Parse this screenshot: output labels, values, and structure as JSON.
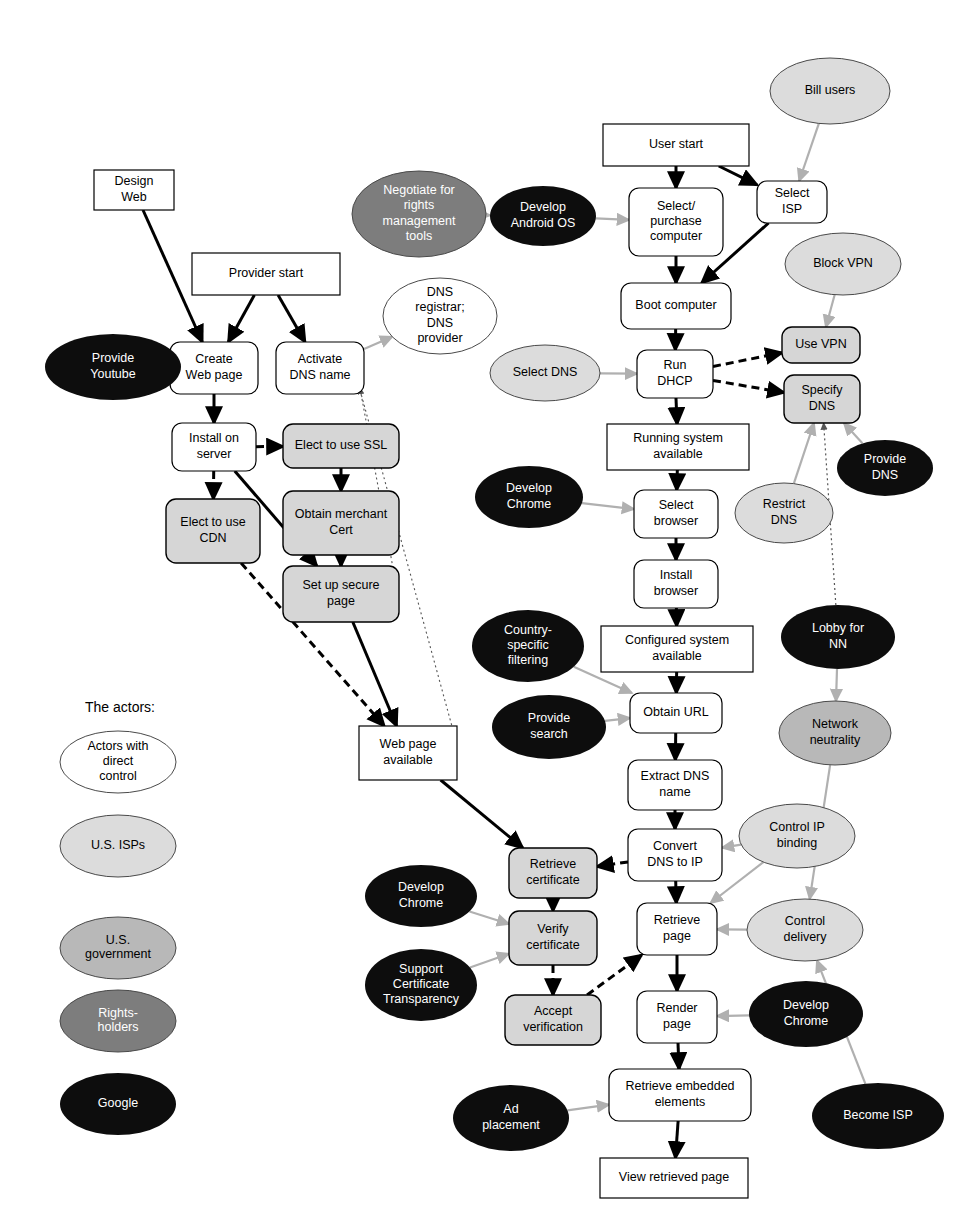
{
  "diagram": {
    "legend": {
      "heading": "The actors:",
      "items": [
        {
          "label": "Actors with direct control",
          "fill": "#ffffff",
          "text": "#000000"
        },
        {
          "label": "U.S. ISPs",
          "fill": "#dcdcdc",
          "text": "#000000"
        },
        {
          "label": "U.S. government",
          "fill": "#b8b8b8",
          "text": "#000000"
        },
        {
          "label": "Rights-holders",
          "fill": "#7d7d7d",
          "text": "#ffffff"
        },
        {
          "label": "Google",
          "fill": "#0d0d0d",
          "text": "#ffffff"
        }
      ]
    },
    "colors": {
      "white": "#ffffff",
      "grey_box": "#d6d6d6",
      "isp": "#dcdcdc",
      "government": "#b8b8b8",
      "rights": "#7d7d7d",
      "google": "#0d0d0d",
      "stroke": "#000000",
      "grey_arrow": "#b0b0b0"
    },
    "process_nodes": [
      {
        "id": "design-web",
        "label": "Design\nWeb",
        "shape": "rect",
        "fill": "#ffffff",
        "x": 94,
        "y": 170,
        "w": 80,
        "h": 40
      },
      {
        "id": "provider-start",
        "label": "Provider start",
        "shape": "rect",
        "fill": "#ffffff",
        "x": 192,
        "y": 253,
        "w": 148,
        "h": 42
      },
      {
        "id": "create-web-page",
        "label": "Create\nWeb page",
        "shape": "round",
        "fill": "#ffffff",
        "x": 170,
        "y": 342,
        "w": 88,
        "h": 52
      },
      {
        "id": "activate-dns-name",
        "label": "Activate\nDNS name",
        "shape": "round",
        "fill": "#ffffff",
        "x": 276,
        "y": 342,
        "w": 88,
        "h": 52
      },
      {
        "id": "install-on-server",
        "label": "Install on\nserver",
        "shape": "round",
        "fill": "#ffffff",
        "x": 172,
        "y": 423,
        "w": 84,
        "h": 48
      },
      {
        "id": "elect-to-use-ssl",
        "label": "Elect to use SSL",
        "shape": "round",
        "fill": "#d6d6d6",
        "x": 283,
        "y": 424,
        "w": 116,
        "h": 44
      },
      {
        "id": "elect-to-use-cdn",
        "label": "Elect to use\nCDN",
        "shape": "round",
        "fill": "#d6d6d6",
        "x": 166,
        "y": 499,
        "w": 94,
        "h": 64
      },
      {
        "id": "obtain-merchant-cert",
        "label": "Obtain merchant\nCert",
        "shape": "round",
        "fill": "#d6d6d6",
        "x": 283,
        "y": 491,
        "w": 116,
        "h": 64
      },
      {
        "id": "set-up-secure-page",
        "label": "Set up secure\npage",
        "shape": "round",
        "fill": "#d6d6d6",
        "x": 283,
        "y": 566,
        "w": 116,
        "h": 56
      },
      {
        "id": "web-page-available",
        "label": "Web page\navailable",
        "shape": "rect",
        "fill": "#ffffff",
        "x": 359,
        "y": 726,
        "w": 98,
        "h": 54
      },
      {
        "id": "user-start",
        "label": "User start",
        "shape": "rect",
        "fill": "#ffffff",
        "x": 603,
        "y": 124,
        "w": 146,
        "h": 42
      },
      {
        "id": "select-isp",
        "label": "Select\nISP",
        "shape": "round",
        "fill": "#ffffff",
        "x": 757,
        "y": 181,
        "w": 70,
        "h": 42
      },
      {
        "id": "select-purchase-computer",
        "label": "Select/\npurchase\ncomputer",
        "shape": "round",
        "fill": "#ffffff",
        "x": 629,
        "y": 188,
        "w": 94,
        "h": 68
      },
      {
        "id": "boot-computer",
        "label": "Boot computer",
        "shape": "round",
        "fill": "#ffffff",
        "x": 621,
        "y": 283,
        "w": 110,
        "h": 46
      },
      {
        "id": "run-dhcp",
        "label": "Run\nDHCP",
        "shape": "round",
        "fill": "#ffffff",
        "x": 637,
        "y": 350,
        "w": 76,
        "h": 48
      },
      {
        "id": "use-vpn",
        "label": "Use VPN",
        "shape": "round",
        "fill": "#d6d6d6",
        "x": 782,
        "y": 327,
        "w": 78,
        "h": 36
      },
      {
        "id": "specify-dns",
        "label": "Specify\nDNS",
        "shape": "round",
        "fill": "#d6d6d6",
        "x": 784,
        "y": 375,
        "w": 76,
        "h": 48
      },
      {
        "id": "running-system-available",
        "label": "Running system\navailable",
        "shape": "rect",
        "fill": "#ffffff",
        "x": 607,
        "y": 424,
        "w": 142,
        "h": 46
      },
      {
        "id": "select-browser",
        "label": "Select\nbrowser",
        "shape": "round",
        "fill": "#ffffff",
        "x": 634,
        "y": 490,
        "w": 84,
        "h": 48
      },
      {
        "id": "install-browser",
        "label": "Install\nbrowser",
        "shape": "round",
        "fill": "#ffffff",
        "x": 634,
        "y": 560,
        "w": 84,
        "h": 48
      },
      {
        "id": "configured-system-available",
        "label": "Configured system\navailable",
        "shape": "rect",
        "fill": "#ffffff",
        "x": 601,
        "y": 626,
        "w": 152,
        "h": 46
      },
      {
        "id": "obtain-url",
        "label": "Obtain URL",
        "shape": "round",
        "fill": "#ffffff",
        "x": 630,
        "y": 693,
        "w": 92,
        "h": 40
      },
      {
        "id": "extract-dns-name",
        "label": "Extract DNS\nname",
        "shape": "round",
        "fill": "#ffffff",
        "x": 628,
        "y": 760,
        "w": 94,
        "h": 50
      },
      {
        "id": "convert-dns-to-ip",
        "label": "Convert\nDNS to IP",
        "shape": "round",
        "fill": "#ffffff",
        "x": 628,
        "y": 829,
        "w": 94,
        "h": 52
      },
      {
        "id": "retrieve-certificate",
        "label": "Retrieve\ncertificate",
        "shape": "round",
        "fill": "#d6d6d6",
        "x": 509,
        "y": 848,
        "w": 88,
        "h": 50
      },
      {
        "id": "verify-certificate",
        "label": "Verify\ncertificate",
        "shape": "round",
        "fill": "#d6d6d6",
        "x": 509,
        "y": 911,
        "w": 88,
        "h": 54
      },
      {
        "id": "accept-verification",
        "label": "Accept\nverification",
        "shape": "round",
        "fill": "#d6d6d6",
        "x": 505,
        "y": 995,
        "w": 96,
        "h": 50
      },
      {
        "id": "retrieve-page",
        "label": "Retrieve\npage",
        "shape": "round",
        "fill": "#ffffff",
        "x": 637,
        "y": 903,
        "w": 80,
        "h": 52
      },
      {
        "id": "render-page",
        "label": "Render\npage",
        "shape": "round",
        "fill": "#ffffff",
        "x": 637,
        "y": 991,
        "w": 80,
        "h": 52
      },
      {
        "id": "retrieve-embedded-elements",
        "label": "Retrieve embedded\nelements",
        "shape": "round",
        "fill": "#ffffff",
        "x": 609,
        "y": 1069,
        "w": 142,
        "h": 52
      },
      {
        "id": "view-retrieved-page",
        "label": "View retrieved page",
        "shape": "rect",
        "fill": "#ffffff",
        "x": 600,
        "y": 1158,
        "w": 148,
        "h": 40
      }
    ],
    "actor_nodes": [
      {
        "id": "provide-youtube",
        "label": "Provide\nYoutube",
        "fill": "#0d0d0d",
        "text": "#ffffff",
        "cx": 113,
        "cy": 367,
        "rx": 68,
        "ry": 33
      },
      {
        "id": "negotiate-rights",
        "label": "Negotiate for\nrights\nmanagement\ntools",
        "fill": "#7d7d7d",
        "text": "#ffffff",
        "cx": 419,
        "cy": 214,
        "rx": 67,
        "ry": 43
      },
      {
        "id": "develop-android-os",
        "label": "Develop\nAndroid OS",
        "fill": "#0d0d0d",
        "text": "#ffffff",
        "cx": 543,
        "cy": 216,
        "rx": 53,
        "ry": 30
      },
      {
        "id": "dns-registrar",
        "label": "DNS\nregistrar;\nDNS\nprovider",
        "fill": "#ffffff",
        "text": "#000000",
        "cx": 440,
        "cy": 316,
        "rx": 57,
        "ry": 38
      },
      {
        "id": "bill-users",
        "label": "Bill users",
        "fill": "#dcdcdc",
        "text": "#000000",
        "cx": 830,
        "cy": 91,
        "rx": 60,
        "ry": 33
      },
      {
        "id": "block-vpn",
        "label": "Block VPN",
        "fill": "#dcdcdc",
        "text": "#000000",
        "cx": 843,
        "cy": 264,
        "rx": 58,
        "ry": 31
      },
      {
        "id": "select-dns",
        "label": "Select DNS",
        "fill": "#dcdcdc",
        "text": "#000000",
        "cx": 545,
        "cy": 373,
        "rx": 55,
        "ry": 28
      },
      {
        "id": "provide-dns",
        "label": "Provide\nDNS",
        "fill": "#0d0d0d",
        "text": "#ffffff",
        "cx": 885,
        "cy": 468,
        "rx": 48,
        "ry": 28
      },
      {
        "id": "develop-chrome-1",
        "label": "Develop\nChrome",
        "fill": "#0d0d0d",
        "text": "#ffffff",
        "cx": 529,
        "cy": 497,
        "rx": 54,
        "ry": 31
      },
      {
        "id": "restrict-dns",
        "label": "Restrict\nDNS",
        "fill": "#dcdcdc",
        "text": "#000000",
        "cx": 784,
        "cy": 513,
        "rx": 49,
        "ry": 30
      },
      {
        "id": "country-specific-filtering",
        "label": "Country-\nspecific\nfiltering",
        "fill": "#0d0d0d",
        "text": "#ffffff",
        "cx": 528,
        "cy": 646,
        "rx": 56,
        "ry": 36
      },
      {
        "id": "lobby-for-nn",
        "label": "Lobby for\nNN",
        "fill": "#0d0d0d",
        "text": "#ffffff",
        "cx": 838,
        "cy": 637,
        "rx": 57,
        "ry": 32
      },
      {
        "id": "provide-search",
        "label": "Provide\nsearch",
        "fill": "#0d0d0d",
        "text": "#ffffff",
        "cx": 549,
        "cy": 727,
        "rx": 57,
        "ry": 32
      },
      {
        "id": "network-neutrality",
        "label": "Network\nneutrality",
        "fill": "#b8b8b8",
        "text": "#000000",
        "cx": 835,
        "cy": 733,
        "rx": 56,
        "ry": 32
      },
      {
        "id": "control-ip-binding",
        "label": "Control IP\nbinding",
        "fill": "#dcdcdc",
        "text": "#000000",
        "cx": 797,
        "cy": 836,
        "rx": 58,
        "ry": 32
      },
      {
        "id": "develop-chrome-2",
        "label": "Develop\nChrome",
        "fill": "#0d0d0d",
        "text": "#ffffff",
        "cx": 421,
        "cy": 896,
        "rx": 56,
        "ry": 31
      },
      {
        "id": "support-cert-transparency",
        "label": "Support\nCertificate\nTransparency",
        "fill": "#0d0d0d",
        "text": "#ffffff",
        "cx": 421,
        "cy": 985,
        "rx": 56,
        "ry": 36
      },
      {
        "id": "control-delivery",
        "label": "Control\ndelivery",
        "fill": "#dcdcdc",
        "text": "#000000",
        "cx": 805,
        "cy": 930,
        "rx": 58,
        "ry": 31
      },
      {
        "id": "develop-chrome-3",
        "label": "Develop\nChrome",
        "fill": "#0d0d0d",
        "text": "#ffffff",
        "cx": 806,
        "cy": 1014,
        "rx": 57,
        "ry": 33
      },
      {
        "id": "ad-placement",
        "label": "Ad\nplacement",
        "fill": "#0d0d0d",
        "text": "#ffffff",
        "cx": 511,
        "cy": 1118,
        "rx": 58,
        "ry": 33
      },
      {
        "id": "become-isp",
        "label": "Become ISP",
        "fill": "#0d0d0d",
        "text": "#ffffff",
        "cx": 878,
        "cy": 1116,
        "rx": 66,
        "ry": 33
      }
    ],
    "edges": [
      {
        "from": "design-web",
        "to": "create-web-page",
        "style": "solid-black"
      },
      {
        "from": "provider-start",
        "to": "create-web-page",
        "style": "solid-black"
      },
      {
        "from": "provider-start",
        "to": "activate-dns-name",
        "style": "solid-black"
      },
      {
        "from": "provide-youtube",
        "to": "create-web-page",
        "style": "grey"
      },
      {
        "from": "create-web-page",
        "to": "install-on-server",
        "style": "solid-black"
      },
      {
        "from": "install-on-server",
        "to": "elect-to-use-ssl",
        "style": "dashed-black"
      },
      {
        "from": "install-on-server",
        "to": "elect-to-use-cdn",
        "style": "dashed-black"
      },
      {
        "from": "install-on-server",
        "to": "set-up-secure-page",
        "style": "solid-black"
      },
      {
        "from": "elect-to-use-ssl",
        "to": "obtain-merchant-cert",
        "style": "dashed-black"
      },
      {
        "from": "obtain-merchant-cert",
        "to": "set-up-secure-page",
        "style": "solid-black"
      },
      {
        "from": "elect-to-use-cdn",
        "to": "web-page-available",
        "style": "dashed-black"
      },
      {
        "from": "set-up-secure-page",
        "to": "web-page-available",
        "style": "solid-black"
      },
      {
        "from": "activate-dns-name",
        "to": "dns-registrar",
        "style": "grey"
      },
      {
        "from": "web-page-available",
        "to": "retrieve-certificate",
        "style": "solid-black"
      },
      {
        "from": "negotiate-rights",
        "to": "develop-android-os",
        "style": "grey"
      },
      {
        "from": "develop-android-os",
        "to": "select-purchase-computer",
        "style": "grey"
      },
      {
        "from": "user-start",
        "to": "select-purchase-computer",
        "style": "solid-black"
      },
      {
        "from": "user-start",
        "to": "select-isp",
        "style": "solid-black"
      },
      {
        "from": "bill-users",
        "to": "select-isp",
        "style": "grey"
      },
      {
        "from": "select-isp",
        "to": "boot-computer",
        "style": "solid-black"
      },
      {
        "from": "select-purchase-computer",
        "to": "boot-computer",
        "style": "solid-black"
      },
      {
        "from": "boot-computer",
        "to": "run-dhcp",
        "style": "solid-black"
      },
      {
        "from": "select-dns",
        "to": "run-dhcp",
        "style": "grey"
      },
      {
        "from": "run-dhcp",
        "to": "use-vpn",
        "style": "dashed-black"
      },
      {
        "from": "run-dhcp",
        "to": "specify-dns",
        "style": "dashed-black"
      },
      {
        "from": "run-dhcp",
        "to": "running-system-available",
        "style": "solid-black"
      },
      {
        "from": "block-vpn",
        "to": "use-vpn",
        "style": "grey"
      },
      {
        "from": "provide-dns",
        "to": "specify-dns",
        "style": "grey"
      },
      {
        "from": "restrict-dns",
        "to": "specify-dns",
        "style": "grey"
      },
      {
        "from": "lobby-for-nn",
        "to": "specify-dns",
        "style": "dotted"
      },
      {
        "from": "running-system-available",
        "to": "select-browser",
        "style": "solid-black"
      },
      {
        "from": "develop-chrome-1",
        "to": "select-browser",
        "style": "grey"
      },
      {
        "from": "select-browser",
        "to": "install-browser",
        "style": "solid-black"
      },
      {
        "from": "install-browser",
        "to": "configured-system-available",
        "style": "solid-black"
      },
      {
        "from": "configured-system-available",
        "to": "obtain-url",
        "style": "solid-black"
      },
      {
        "from": "country-specific-filtering",
        "to": "obtain-url",
        "style": "grey"
      },
      {
        "from": "provide-search",
        "to": "obtain-url",
        "style": "grey"
      },
      {
        "from": "obtain-url",
        "to": "extract-dns-name",
        "style": "solid-black"
      },
      {
        "from": "extract-dns-name",
        "to": "convert-dns-to-ip",
        "style": "solid-black"
      },
      {
        "from": "convert-dns-to-ip",
        "to": "retrieve-certificate",
        "style": "dashed-black"
      },
      {
        "from": "convert-dns-to-ip",
        "to": "retrieve-page",
        "style": "solid-black"
      },
      {
        "from": "control-ip-binding",
        "to": "convert-dns-to-ip",
        "style": "grey"
      },
      {
        "from": "retrieve-certificate",
        "to": "verify-certificate",
        "style": "dashed-black"
      },
      {
        "from": "develop-chrome-2",
        "to": "verify-certificate",
        "style": "grey"
      },
      {
        "from": "support-cert-transparency",
        "to": "verify-certificate",
        "style": "grey"
      },
      {
        "from": "verify-certificate",
        "to": "accept-verification",
        "style": "dashed-black"
      },
      {
        "from": "accept-verification",
        "to": "retrieve-page",
        "style": "dashed-black"
      },
      {
        "from": "control-ip-binding",
        "to": "retrieve-page",
        "style": "grey"
      },
      {
        "from": "control-delivery",
        "to": "retrieve-page",
        "style": "grey"
      },
      {
        "from": "retrieve-page",
        "to": "render-page",
        "style": "solid-black"
      },
      {
        "from": "develop-chrome-3",
        "to": "render-page",
        "style": "grey"
      },
      {
        "from": "render-page",
        "to": "retrieve-embedded-elements",
        "style": "solid-black"
      },
      {
        "from": "ad-placement",
        "to": "retrieve-embedded-elements",
        "style": "grey"
      },
      {
        "from": "retrieve-embedded-elements",
        "to": "view-retrieved-page",
        "style": "solid-black"
      },
      {
        "from": "lobby-for-nn",
        "to": "network-neutrality",
        "style": "grey"
      },
      {
        "from": "network-neutrality",
        "to": "control-delivery",
        "style": "grey"
      },
      {
        "from": "become-isp",
        "to": "control-delivery",
        "style": "grey"
      }
    ]
  }
}
